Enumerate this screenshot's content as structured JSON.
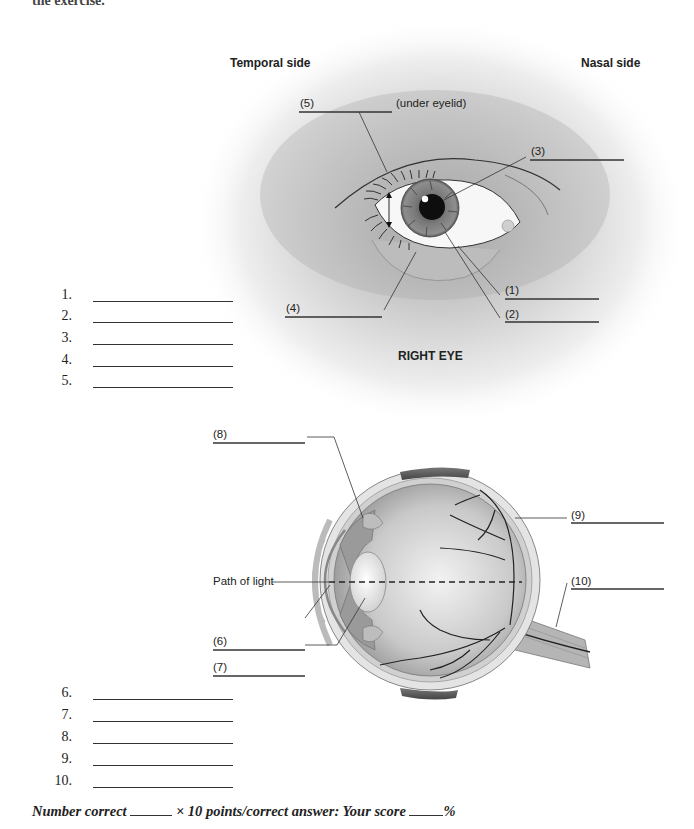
{
  "page": {
    "intro_cut_text": "the exercise."
  },
  "diagram1": {
    "title": "RIGHT EYE",
    "side_left": "Temporal side",
    "side_right": "Nasal side",
    "labels": {
      "l1": "(1)",
      "l2": "(2)",
      "l3": "(3)",
      "l4": "(4)",
      "l5": "(5)",
      "l5_note": "(under eyelid)"
    }
  },
  "diagram2": {
    "path_of_light": "Path of light",
    "labels": {
      "l6": "(6)",
      "l7": "(7)",
      "l8": "(8)",
      "l9": "(9)",
      "l10": "(10)"
    }
  },
  "answers_group1": [
    {
      "number": "1.",
      "value": ""
    },
    {
      "number": "2.",
      "value": ""
    },
    {
      "number": "3.",
      "value": ""
    },
    {
      "number": "4.",
      "value": ""
    },
    {
      "number": "5.",
      "value": ""
    }
  ],
  "answers_group2": [
    {
      "number": "6.",
      "value": ""
    },
    {
      "number": "7.",
      "value": ""
    },
    {
      "number": "8.",
      "value": ""
    },
    {
      "number": "9.",
      "value": ""
    },
    {
      "number": "10.",
      "value": ""
    }
  ],
  "score": {
    "number_correct_label": "Number correct",
    "multiplier": "× 10 points/correct answer: Your score",
    "percent": "%",
    "number_correct_value": "",
    "score_value": ""
  }
}
